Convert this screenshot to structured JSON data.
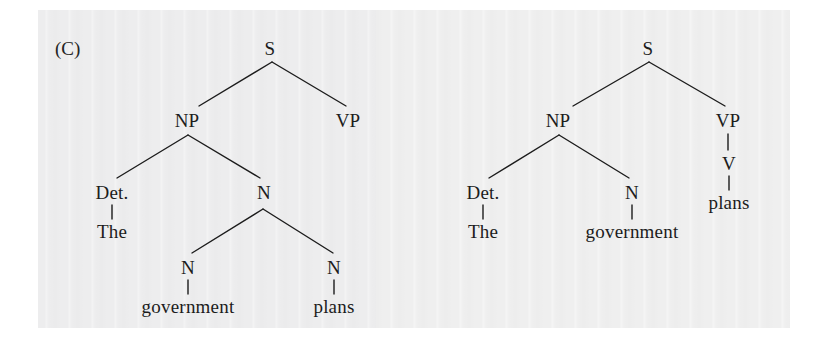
{
  "figure": {
    "label": "(C)",
    "background_color": "#ededee",
    "ink_color": "#1c1c1c"
  },
  "trees": [
    {
      "id": "tree-left",
      "sentence": "The government plans",
      "reading": "compound-noun reading: 'The government plans' as a noun phrase",
      "nodes": [
        {
          "id": "L-S",
          "label": "S",
          "x": 270,
          "y": 48,
          "kind": "nonterminal"
        },
        {
          "id": "L-NP",
          "label": "NP",
          "x": 187,
          "y": 120,
          "kind": "nonterminal"
        },
        {
          "id": "L-VP",
          "label": "VP",
          "x": 348,
          "y": 120,
          "kind": "nonterminal"
        },
        {
          "id": "L-Det",
          "label": "Det.",
          "x": 112,
          "y": 192,
          "kind": "nonterminal"
        },
        {
          "id": "L-N",
          "label": "N",
          "x": 264,
          "y": 192,
          "kind": "nonterminal"
        },
        {
          "id": "L-The",
          "label": "The",
          "x": 112,
          "y": 231,
          "kind": "terminal"
        },
        {
          "id": "L-N1",
          "label": "N",
          "x": 188,
          "y": 267,
          "kind": "nonterminal"
        },
        {
          "id": "L-N2",
          "label": "N",
          "x": 334,
          "y": 267,
          "kind": "nonterminal"
        },
        {
          "id": "L-gov",
          "label": "government",
          "x": 188,
          "y": 306,
          "kind": "terminal"
        },
        {
          "id": "L-plans",
          "label": "plans",
          "x": 334,
          "y": 306,
          "kind": "terminal"
        }
      ],
      "edges": [
        {
          "from": "L-S",
          "to": "L-NP",
          "x1": 272,
          "y1": 62,
          "x2": 199,
          "y2": 106
        },
        {
          "from": "L-S",
          "to": "L-VP",
          "x1": 272,
          "y1": 62,
          "x2": 346,
          "y2": 106
        },
        {
          "from": "L-NP",
          "to": "L-Det",
          "x1": 188,
          "y1": 135,
          "x2": 117,
          "y2": 178
        },
        {
          "from": "L-NP",
          "to": "L-N",
          "x1": 188,
          "y1": 135,
          "x2": 260,
          "y2": 178
        },
        {
          "from": "L-Det",
          "to": "L-The",
          "x1": 112,
          "y1": 205,
          "x2": 112,
          "y2": 219
        },
        {
          "from": "L-N",
          "to": "L-N1",
          "x1": 263,
          "y1": 209,
          "x2": 192,
          "y2": 253
        },
        {
          "from": "L-N",
          "to": "L-N2",
          "x1": 263,
          "y1": 209,
          "x2": 333,
          "y2": 253
        },
        {
          "from": "L-N1",
          "to": "L-gov",
          "x1": 188,
          "y1": 280,
          "x2": 188,
          "y2": 294
        },
        {
          "from": "L-N2",
          "to": "L-plans",
          "x1": 334,
          "y1": 280,
          "x2": 334,
          "y2": 294
        }
      ]
    },
    {
      "id": "tree-right",
      "sentence": "The government plans",
      "reading": "clausal reading: 'The government' subject, 'plans' as verb",
      "nodes": [
        {
          "id": "R-S",
          "label": "S",
          "x": 648,
          "y": 48,
          "kind": "nonterminal"
        },
        {
          "id": "R-NP",
          "label": "NP",
          "x": 558,
          "y": 120,
          "kind": "nonterminal"
        },
        {
          "id": "R-VP",
          "label": "VP",
          "x": 728,
          "y": 120,
          "kind": "nonterminal"
        },
        {
          "id": "R-Det",
          "label": "Det.",
          "x": 483,
          "y": 192,
          "kind": "nonterminal"
        },
        {
          "id": "R-N",
          "label": "N",
          "x": 632,
          "y": 192,
          "kind": "nonterminal"
        },
        {
          "id": "R-V",
          "label": "V",
          "x": 729,
          "y": 163,
          "kind": "nonterminal"
        },
        {
          "id": "R-The",
          "label": "The",
          "x": 483,
          "y": 231,
          "kind": "terminal"
        },
        {
          "id": "R-gov",
          "label": "government",
          "x": 632,
          "y": 231,
          "kind": "terminal"
        },
        {
          "id": "R-plans",
          "label": "plans",
          "x": 729,
          "y": 202,
          "kind": "terminal"
        }
      ],
      "edges": [
        {
          "from": "R-S",
          "to": "R-NP",
          "x1": 649,
          "y1": 62,
          "x2": 573,
          "y2": 106
        },
        {
          "from": "R-S",
          "to": "R-VP",
          "x1": 649,
          "y1": 62,
          "x2": 725,
          "y2": 106
        },
        {
          "from": "R-NP",
          "to": "R-Det",
          "x1": 559,
          "y1": 135,
          "x2": 489,
          "y2": 178
        },
        {
          "from": "R-NP",
          "to": "R-N",
          "x1": 559,
          "y1": 135,
          "x2": 629,
          "y2": 178
        },
        {
          "from": "R-VP",
          "to": "R-V",
          "x1": 728,
          "y1": 134,
          "x2": 728,
          "y2": 150
        },
        {
          "from": "R-Det",
          "to": "R-The",
          "x1": 483,
          "y1": 205,
          "x2": 483,
          "y2": 219
        },
        {
          "from": "R-N",
          "to": "R-gov",
          "x1": 632,
          "y1": 205,
          "x2": 632,
          "y2": 219
        },
        {
          "from": "R-V",
          "to": "R-plans",
          "x1": 729,
          "y1": 176,
          "x2": 729,
          "y2": 190
        }
      ]
    }
  ]
}
